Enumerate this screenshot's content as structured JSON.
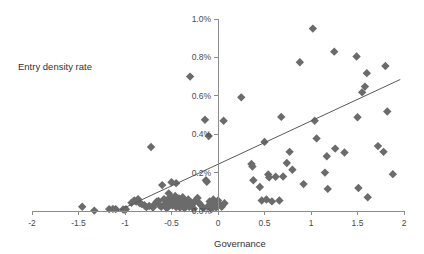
{
  "chart_data": {
    "type": "scatter",
    "title": "",
    "xlabel": "Governance",
    "ylabel": "Entry density rate",
    "series_label": "Entry density rate",
    "xlim": [
      -2,
      2
    ],
    "ylim": [
      0,
      0.01
    ],
    "grid": false,
    "legend_position": "none",
    "marker_shape": "diamond",
    "marker_color": "#6b6b6b",
    "trendline_color": "#5a5a5a",
    "axis_color": "#8c8c8c",
    "xticks": [
      -2,
      -1.5,
      -1,
      -0.5,
      0,
      0.5,
      1,
      1.5,
      2
    ],
    "xticklabels": [
      "-2",
      "-1.5",
      "-1",
      "-0.5",
      "0",
      "0.5",
      "1",
      "1.5",
      "2"
    ],
    "yticks": [
      0,
      0.002,
      0.004,
      0.006,
      0.008,
      0.01
    ],
    "yticklabels": [
      "0.0%",
      "0.2%",
      "0.4%",
      "0.6%",
      "0.8%",
      "1.0%"
    ],
    "trendline": {
      "x0": -1.08,
      "y0": 0.0,
      "x1": 1.96,
      "y1": 0.00685
    },
    "points": [
      [
        -1.46,
        0.00022
      ],
      [
        -1.33,
        2e-05
      ],
      [
        -1.17,
        0.0001
      ],
      [
        -1.13,
        0.00011
      ],
      [
        -1.1,
        0.0001
      ],
      [
        -1.02,
        8e-05
      ],
      [
        -1.0,
        6e-05
      ],
      [
        -0.99,
        9e-05
      ],
      [
        -0.93,
        0.00043
      ],
      [
        -0.9,
        0.00055
      ],
      [
        -0.88,
        0.00049
      ],
      [
        -0.86,
        0.00062
      ],
      [
        -0.84,
        0.0004
      ],
      [
        -0.82,
        0.00036
      ],
      [
        -0.79,
        0.0003
      ],
      [
        -0.77,
        0.0002
      ],
      [
        -0.74,
        0.00026
      ],
      [
        -0.72,
        0.00333
      ],
      [
        -0.7,
        0.00018
      ],
      [
        -0.68,
        0.00036
      ],
      [
        -0.66,
        0.00048
      ],
      [
        -0.64,
        0.00052
      ],
      [
        -0.63,
        0.0003
      ],
      [
        -0.61,
        0.00022
      ],
      [
        -0.6,
        0.00135
      ],
      [
        -0.58,
        0.00062
      ],
      [
        -0.57,
        0.00038
      ],
      [
        -0.56,
        0.00024
      ],
      [
        -0.55,
        0.00014
      ],
      [
        -0.54,
        0.0006
      ],
      [
        -0.53,
        0.00092
      ],
      [
        -0.52,
        0.00044
      ],
      [
        -0.51,
        0.00033
      ],
      [
        -0.5,
        0.0007
      ],
      [
        -0.5,
        0.0015
      ],
      [
        -0.49,
        0.00028
      ],
      [
        -0.48,
        0.00055
      ],
      [
        -0.47,
        0.00042
      ],
      [
        -0.46,
        0.00078
      ],
      [
        -0.45,
        0.0002
      ],
      [
        -0.45,
        0.00145
      ],
      [
        -0.44,
        0.00058
      ],
      [
        -0.43,
        0.00033
      ],
      [
        -0.42,
        0.00066
      ],
      [
        -0.41,
        0.00018
      ],
      [
        -0.4,
        0.00048
      ],
      [
        -0.39,
        0.00026
      ],
      [
        -0.38,
        0.00072
      ],
      [
        -0.37,
        0.0004
      ],
      [
        -0.36,
        0.00014
      ],
      [
        -0.35,
        0.00052
      ],
      [
        -0.34,
        0.0003
      ],
      [
        -0.32,
        0.0006
      ],
      [
        -0.31,
        0.00022
      ],
      [
        -0.3,
        0.007
      ],
      [
        -0.29,
        0.00044
      ],
      [
        -0.27,
        0.00036
      ],
      [
        -0.26,
        0.00012
      ],
      [
        -0.24,
        0.00056
      ],
      [
        -0.22,
        0.00068
      ],
      [
        -0.2,
        0.0004
      ],
      [
        -0.18,
        0.00028
      ],
      [
        -0.16,
        0.00016
      ],
      [
        -0.14,
        0.00475
      ],
      [
        -0.13,
        0.0016
      ],
      [
        -0.12,
        0.00152
      ],
      [
        -0.11,
        0.00024
      ],
      [
        -0.1,
        0.0039
      ],
      [
        -0.09,
        0.0005
      ],
      [
        -0.08,
        0.00038
      ],
      [
        -0.07,
        0.0001
      ],
      [
        -0.05,
        0.0006
      ],
      [
        -0.04,
        0.0003
      ],
      [
        -0.03,
        0.00046
      ],
      [
        -0.02,
        0.00018
      ],
      [
        0.0,
        0.00055
      ],
      [
        0.02,
        0.00035
      ],
      [
        0.04,
        0.00022
      ],
      [
        0.06,
        0.0047
      ],
      [
        0.07,
        0.0004
      ],
      [
        0.25,
        0.00592
      ],
      [
        0.36,
        0.00245
      ],
      [
        0.37,
        0.00232
      ],
      [
        0.38,
        0.0016
      ],
      [
        0.45,
        0.00125
      ],
      [
        0.47,
        0.00055
      ],
      [
        0.5,
        0.0036
      ],
      [
        0.52,
        0.0006
      ],
      [
        0.54,
        0.0019
      ],
      [
        0.55,
        0.00175
      ],
      [
        0.58,
        0.0005
      ],
      [
        0.62,
        0.00178
      ],
      [
        0.66,
        0.00055
      ],
      [
        0.68,
        0.0049
      ],
      [
        0.7,
        0.0018
      ],
      [
        0.74,
        0.0025
      ],
      [
        0.77,
        0.00308
      ],
      [
        0.8,
        0.00215
      ],
      [
        0.88,
        0.00775
      ],
      [
        0.92,
        0.0014
      ],
      [
        1.02,
        0.0095
      ],
      [
        1.04,
        0.0047
      ],
      [
        1.06,
        0.00378
      ],
      [
        1.15,
        0.002
      ],
      [
        1.17,
        0.00285
      ],
      [
        1.18,
        0.00115
      ],
      [
        1.25,
        0.0083
      ],
      [
        1.26,
        0.00325
      ],
      [
        1.36,
        0.00305
      ],
      [
        1.49,
        0.00805
      ],
      [
        1.5,
        0.00488
      ],
      [
        1.51,
        0.0012
      ],
      [
        1.55,
        0.00618
      ],
      [
        1.58,
        0.00648
      ],
      [
        1.6,
        0.00718
      ],
      [
        1.61,
        0.00072
      ],
      [
        1.72,
        0.00338
      ],
      [
        1.78,
        0.00308
      ],
      [
        1.8,
        0.00755
      ],
      [
        1.82,
        0.00518
      ],
      [
        1.88,
        0.00192
      ]
    ]
  }
}
